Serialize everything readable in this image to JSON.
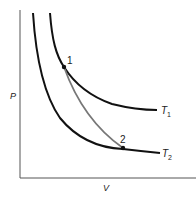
{
  "diagram": {
    "type": "PV diagram",
    "axes": {
      "y_label": "P",
      "x_label": "V"
    },
    "isotherms": [
      {
        "label": "T",
        "subscript": "1",
        "name": "T1"
      },
      {
        "label": "T",
        "subscript": "2",
        "name": "T2"
      }
    ],
    "points": [
      {
        "label": "1"
      },
      {
        "label": "2"
      }
    ],
    "colors": {
      "isotherm": "#111111",
      "adiabat": "#777777",
      "axis": "#555555"
    }
  }
}
